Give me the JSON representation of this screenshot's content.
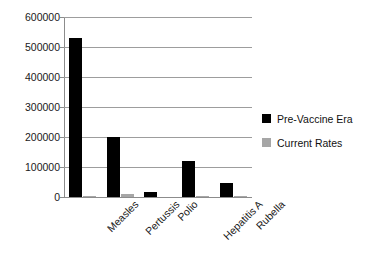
{
  "chart_data": {
    "type": "bar",
    "title": "",
    "xlabel": "",
    "ylabel": "",
    "ylim": [
      0,
      600000
    ],
    "ytick_labels": [
      "600000",
      "500000",
      "400000",
      "300000",
      "200000",
      "100000",
      "0"
    ],
    "yticks": [
      600000,
      500000,
      400000,
      300000,
      200000,
      100000,
      0
    ],
    "grid": true,
    "legend_position": "right",
    "categories": [
      "Measles",
      "Pertussis",
      "Polio",
      "Hepatitis A",
      "Rubella"
    ],
    "series": [
      {
        "name": "Pre-Vaccine Era",
        "color": "#000000",
        "values": [
          530000,
          200000,
          16000,
          120000,
          48000
        ]
      },
      {
        "name": "Current Rates",
        "color": "#a6a6a6",
        "values": [
          100,
          10000,
          0,
          5000,
          100
        ]
      }
    ]
  },
  "legend": {
    "items": [
      {
        "label": "Pre-Vaccine Era",
        "color": "#000000"
      },
      {
        "label": "Current Rates",
        "color": "#a6a6a6"
      }
    ]
  }
}
